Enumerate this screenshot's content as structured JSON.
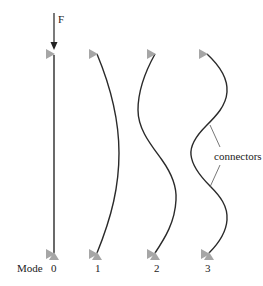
{
  "figure": {
    "force_label": "F",
    "row_label": "Mode",
    "modes": [
      {
        "label": "0",
        "shape": "straight"
      },
      {
        "label": "1",
        "shape": "half-wave"
      },
      {
        "label": "2",
        "shape": "full-wave"
      },
      {
        "label": "3",
        "shape": "one-and-half-wave"
      }
    ],
    "annotation": "connectors",
    "colors": {
      "beam": "#2a2a2a",
      "support": "#a6a6a6",
      "text": "#222222"
    }
  }
}
